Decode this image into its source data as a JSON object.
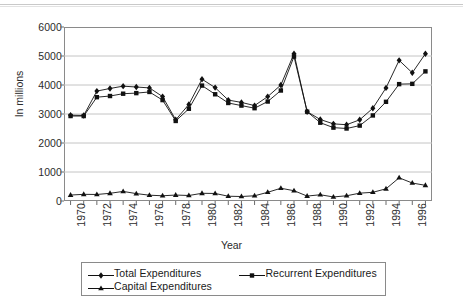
{
  "chart_data": {
    "type": "line",
    "title": "",
    "xlabel": "Year",
    "ylabel": "In millions",
    "xlim": [
      1969.5,
      1997.5
    ],
    "ylim": [
      0,
      6000
    ],
    "grid": true,
    "legend_position": "bottom",
    "y_ticks": [
      0,
      1000,
      2000,
      3000,
      4000,
      5000,
      6000
    ],
    "y_tick_labels": [
      "0",
      "1000",
      "2000",
      "3000",
      "4000",
      "5000",
      "6000"
    ],
    "x": [
      1970,
      1971,
      1972,
      1973,
      1974,
      1975,
      1976,
      1977,
      1978,
      1979,
      1980,
      1981,
      1982,
      1983,
      1984,
      1985,
      1986,
      1987,
      1988,
      1989,
      1990,
      1991,
      1992,
      1993,
      1994,
      1995,
      1996,
      1997
    ],
    "x_tick_labels": [
      "1970",
      "1972",
      "1974",
      "1976",
      "1978",
      "1980",
      "1982",
      "1984",
      "1986",
      "1988",
      "1990",
      "1992",
      "1994",
      "1996"
    ],
    "x_tick_values": [
      1970,
      1972,
      1974,
      1976,
      1978,
      1980,
      1982,
      1984,
      1986,
      1988,
      1990,
      1992,
      1994,
      1996
    ],
    "series": [
      {
        "name": "Total Expenditures",
        "marker": "diamond",
        "color": "#111111",
        "values": [
          2960,
          2950,
          3790,
          3880,
          3960,
          3930,
          3900,
          3600,
          2800,
          3330,
          4200,
          3910,
          3480,
          3400,
          3290,
          3600,
          4000,
          5080,
          3080,
          2810,
          2660,
          2630,
          2800,
          3200,
          3900,
          4850,
          4420,
          5080
        ]
      },
      {
        "name": "Recurrent Expenditures",
        "marker": "square",
        "color": "#111111",
        "values": [
          2930,
          2930,
          3580,
          3620,
          3700,
          3720,
          3760,
          3480,
          2760,
          3180,
          3980,
          3680,
          3380,
          3290,
          3200,
          3430,
          3810,
          4980,
          3080,
          2700,
          2530,
          2500,
          2600,
          2950,
          3420,
          4030,
          4040,
          4470
        ]
      },
      {
        "name": "Capital Expenditures",
        "marker": "triangle",
        "color": "#111111",
        "values": [
          205,
          230,
          225,
          265,
          330,
          255,
          200,
          180,
          205,
          190,
          265,
          260,
          165,
          155,
          180,
          300,
          440,
          355,
          170,
          215,
          140,
          180,
          270,
          300,
          420,
          800,
          620,
          540
        ]
      }
    ]
  },
  "legend": {
    "entries": [
      {
        "label": "Total Expenditures",
        "marker": "diamond"
      },
      {
        "label": "Recurrent Expenditures",
        "marker": "square"
      },
      {
        "label": "Capital Expenditures",
        "marker": "triangle"
      }
    ]
  },
  "axes": {
    "y_title": "In millions",
    "x_title": "Year"
  }
}
